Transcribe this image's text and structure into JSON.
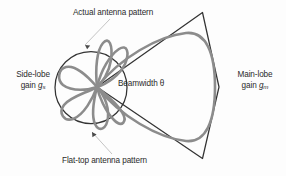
{
  "figure": {
    "background_color": "#fdfdfd"
  },
  "labels": {
    "actual_pattern": "Actual antenna pattern",
    "flat_top_pattern": "Flat-top antenna pattern",
    "side_lobe_line1": "Side-lobe",
    "side_lobe_line2_text": "gain",
    "side_lobe_symbol": "g",
    "side_lobe_subscript": "s",
    "main_lobe_line1": "Main-lobe",
    "main_lobe_line2_text": "gain",
    "main_lobe_symbol": "g",
    "main_lobe_subscript": "m",
    "beamwidth_text": "Beamwidth",
    "beamwidth_symbol": "θ"
  },
  "colors": {
    "actual_pattern_stroke": "#8c8c8c",
    "flat_top_stroke": "#333333",
    "leader_line_stroke": "#b5b5b5",
    "text": "#2b2b2b"
  },
  "geometry": {
    "origin_x": 97,
    "origin_y": 87,
    "side_lobe_circle_radius": 36,
    "main_lobe_tip_x": 218,
    "wedge_top_vertex": "202,12",
    "wedge_bottom_vertex": "202,158"
  }
}
